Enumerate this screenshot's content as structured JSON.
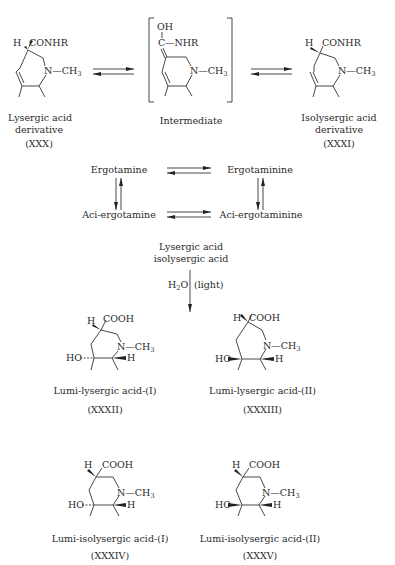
{
  "top_row": {
    "left": {
      "substituent": "CONHR",
      "h_label": "H",
      "n_group": "N—CH",
      "n_sub": "3",
      "name_line1": "Lysergic acid",
      "name_line2": "derivative",
      "id": "(XXX)"
    },
    "middle": {
      "oh": "OH",
      "c_label": "C",
      "nhr": "—NHR",
      "n_group": "N—CH",
      "n_sub": "3",
      "name": "Intermediate"
    },
    "right": {
      "substituent": "CONHR",
      "h_label": "H",
      "n_group": "N—CH",
      "n_sub": "3",
      "name_line1": "Isolysergic acid",
      "name_line2": "derivative",
      "id": "(XXXI)"
    }
  },
  "equilibrium_square": {
    "top_left": "Ergotamine",
    "top_right": "Ergotaminine",
    "bottom_left": "Aci-ergotamine",
    "bottom_right": "Aci-ergotaminine"
  },
  "reaction": {
    "reactant_line1": "Lysergic acid",
    "reactant_line2": "isolysergic acid",
    "reagent": "H",
    "reagent_sub": "2",
    "reagent_tail": "O",
    "condition": "(light)"
  },
  "products": [
    {
      "name": "Lumi-lysergic acid-(I)",
      "id": "(XXXII)",
      "h": "H",
      "cooh": "COOH",
      "n": "N—CH",
      "n_sub": "3",
      "ho": "HO",
      "h2": "H"
    },
    {
      "name": "Lumi-lysergic acid-(II)",
      "id": "(XXXIII)",
      "h": "H",
      "cooh": "COOH",
      "n": "N—CH",
      "n_sub": "3",
      "ho": "HO",
      "h2": "H"
    },
    {
      "name": "Lumi-isolysergic acid-(I)",
      "id": "(XXXIV)",
      "h": "H",
      "cooh": "COOH",
      "n": "N—CH",
      "n_sub": "3",
      "ho": "HO",
      "h2": "H"
    },
    {
      "name": "Lumi-isolysergic acid-(II)",
      "id": "(XXXV)",
      "h": "H",
      "cooh": "COOH",
      "n": "N—CH",
      "n_sub": "3",
      "ho": "HO",
      "h2": "H"
    }
  ]
}
